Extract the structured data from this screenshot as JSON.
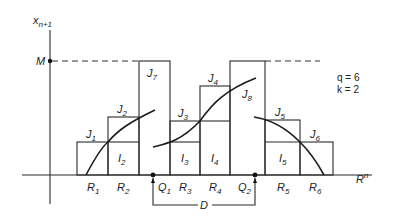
{
  "diagram": {
    "y_axis_label": "x",
    "y_axis_sub": "n+1",
    "x_axis_label": "R",
    "x_axis_sup": "n",
    "max_label": "M",
    "params": {
      "q": "q = 6",
      "k": "k = 2"
    },
    "span_label": "D",
    "points": [
      {
        "name": "Q",
        "sub": "1"
      },
      {
        "name": "Q",
        "sub": "2"
      }
    ],
    "regions": [
      {
        "name": "R",
        "sub": "1"
      },
      {
        "name": "R",
        "sub": "2"
      },
      {
        "name": "R",
        "sub": "3"
      },
      {
        "name": "R",
        "sub": "4"
      },
      {
        "name": "R",
        "sub": "5"
      },
      {
        "name": "R",
        "sub": "6"
      }
    ],
    "boxes_J": [
      {
        "name": "J",
        "sub": "1"
      },
      {
        "name": "J",
        "sub": "2"
      },
      {
        "name": "J",
        "sub": "3"
      },
      {
        "name": "J",
        "sub": "4"
      },
      {
        "name": "J",
        "sub": "5"
      },
      {
        "name": "J",
        "sub": "6"
      },
      {
        "name": "J",
        "sub": "7"
      },
      {
        "name": "J",
        "sub": "8"
      }
    ],
    "boxes_I": [
      {
        "name": "I",
        "sub": "2"
      },
      {
        "name": "I",
        "sub": "3"
      },
      {
        "name": "I",
        "sub": "4"
      },
      {
        "name": "I",
        "sub": "5"
      }
    ]
  }
}
